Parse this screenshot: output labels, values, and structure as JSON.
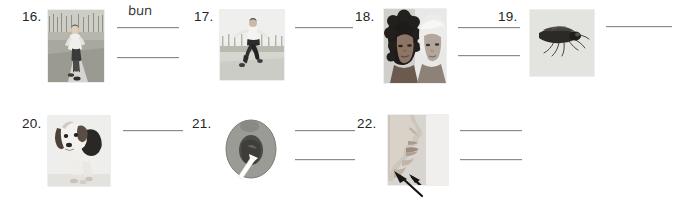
{
  "worksheet": {
    "background_color": "#ffffff",
    "line_color": "#8c8c8c",
    "items": [
      {
        "number": "16.",
        "picture": "runner-on-road",
        "picture_alt": "person running on a paved road",
        "answer_lines": 2,
        "answers": [
          "bun",
          ""
        ]
      },
      {
        "number": "17.",
        "picture": "man-jumping",
        "picture_alt": "man leaping in the air outdoors",
        "answer_lines": 1,
        "answers": [
          ""
        ]
      },
      {
        "number": "18.",
        "picture": "two-heads-of-hair",
        "picture_alt": "two people, one with dark curly hair and one with light hair",
        "answer_lines": 2,
        "answers": [
          "",
          ""
        ]
      },
      {
        "number": "19.",
        "picture": "insect-fly",
        "picture_alt": "winged insect with long legs",
        "answer_lines": 1,
        "answers": [
          ""
        ]
      },
      {
        "number": "20.",
        "picture": "beagle-dog",
        "picture_alt": "beagle dog standing",
        "answer_lines": 1,
        "answers": [
          ""
        ]
      },
      {
        "number": "21.",
        "picture": "peach-cross-section-with-arrow",
        "picture_alt": "halved peach with a white arrow pointing at the pit",
        "answer_lines": 2,
        "answers": [
          "",
          ""
        ]
      },
      {
        "number": "22.",
        "picture": "face-profile-with-arrow",
        "picture_alt": "side profile of a face with a black arrow pointing at the chin",
        "answer_lines": 2,
        "answers": [
          "",
          ""
        ]
      }
    ]
  }
}
